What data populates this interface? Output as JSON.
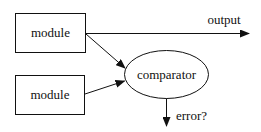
{
  "diagram": {
    "nodes": [
      {
        "id": "module-1",
        "shape": "box",
        "label": "module"
      },
      {
        "id": "module-2",
        "shape": "box",
        "label": "module"
      },
      {
        "id": "comparator",
        "shape": "ellipse",
        "label": "comparator"
      }
    ],
    "edges": [
      {
        "from": "module-1",
        "to": "output",
        "label": "output"
      },
      {
        "from": "module-1",
        "to": "comparator",
        "label": ""
      },
      {
        "from": "module-2",
        "to": "comparator",
        "label": ""
      },
      {
        "from": "comparator",
        "to": "error",
        "label": "error?"
      }
    ]
  },
  "labels": {
    "module_top": "module",
    "module_bottom": "module",
    "comparator": "comparator",
    "output": "output",
    "error": "error?"
  },
  "colors": {
    "stroke": "#111111",
    "background": "#ffffff"
  }
}
